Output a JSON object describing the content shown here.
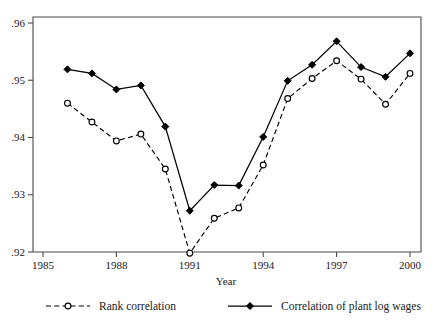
{
  "chart_data": {
    "type": "line",
    "title": "",
    "xlabel": "Year",
    "ylabel": "",
    "xlim": [
      1985,
      2000.8
    ],
    "ylim": [
      0.92,
      0.96
    ],
    "grid": false,
    "legend_position": "bottom",
    "x": [
      1986,
      1987,
      1988,
      1989,
      1990,
      1991,
      1992,
      1993,
      1994,
      1995,
      1996,
      1997,
      1998,
      1999,
      2000
    ],
    "xticks": [
      1985,
      1988,
      1991,
      1994,
      1997,
      2000
    ],
    "xtick_labels": [
      "1985",
      "1988",
      "1991",
      "1994",
      "1997",
      "2000"
    ],
    "yticks": [
      0.92,
      0.93,
      0.94,
      0.95,
      0.96
    ],
    "ytick_labels": [
      ".92",
      ".93",
      ".94",
      ".95",
      ".96"
    ],
    "series": [
      {
        "name": "Rank correlation",
        "marker": "open-circle",
        "line_style": "dashed",
        "color": "#000000",
        "values": [
          0.946,
          0.9427,
          0.9394,
          0.9406,
          0.9345,
          0.9198,
          0.9259,
          0.9277,
          0.9352,
          0.9468,
          0.9503,
          0.9534,
          0.9502,
          0.9458,
          0.9512
        ]
      },
      {
        "name": "Correlation of plant log wages",
        "marker": "filled-diamond",
        "line_style": "solid",
        "color": "#000000",
        "values": [
          0.9519,
          0.9512,
          0.9484,
          0.9491,
          0.9419,
          0.9272,
          0.9317,
          0.9316,
          0.9401,
          0.9499,
          0.9527,
          0.9568,
          0.9523,
          0.9506,
          0.9547
        ]
      }
    ]
  },
  "legend": {
    "entries": [
      {
        "label": "Rank correlation",
        "marker": "open-circle",
        "line_style": "dashed"
      },
      {
        "label": "Correlation of plant log wages",
        "marker": "filled-diamond",
        "line_style": "solid"
      }
    ]
  },
  "axes": {
    "x_title": "Year"
  }
}
